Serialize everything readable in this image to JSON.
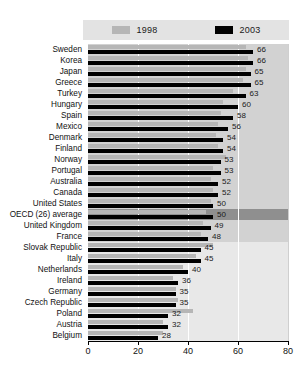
{
  "legend": {
    "entries": [
      {
        "label": "1998",
        "color": "#b6b6b6",
        "icon": "legend-swatch-1998"
      },
      {
        "label": "2003",
        "color": "#000000",
        "icon": "legend-swatch-2003"
      }
    ]
  },
  "axis": {
    "ticks": [
      "0",
      "20",
      "40",
      "60",
      "80"
    ],
    "tick_values": [
      0,
      20,
      40,
      60,
      80
    ],
    "min": 0,
    "max": 80
  },
  "highlight_row": "OECD (26) average",
  "chart_data": {
    "type": "bar",
    "orientation": "horizontal",
    "title": "",
    "subtitle": "",
    "xlabel": "",
    "ylabel": "",
    "xlim": [
      0,
      80
    ],
    "grid": true,
    "legend_position": "top",
    "categories": [
      "Sweden",
      "Korea",
      "Japan",
      "Greece",
      "Turkey",
      "Hungary",
      "Spain",
      "Mexico",
      "Denmark",
      "Finland",
      "Norway",
      "Portugal",
      "Australia",
      "Canada",
      "United States",
      "OECD (26) average",
      "United Kingdom",
      "France",
      "Slovak Republic",
      "Italy",
      "Netherlands",
      "Ireland",
      "Germany",
      "Czech Republic",
      "Poland",
      "Austria",
      "Belgium"
    ],
    "series": [
      {
        "name": "1998",
        "color": "#b6b6b6",
        "values": [
          63,
          64,
          63,
          62,
          58,
          54,
          53,
          52,
          51,
          52,
          55,
          50,
          49,
          50,
          49,
          47,
          46,
          45,
          50,
          43,
          38,
          34,
          35,
          36,
          42,
          30,
          30
        ]
      },
      {
        "name": "2003",
        "color": "#000000",
        "values": [
          66,
          66,
          65,
          65,
          63,
          60,
          58,
          56,
          54,
          54,
          53,
          53,
          52,
          52,
          50,
          50,
          49,
          48,
          45,
          45,
          40,
          36,
          35,
          35,
          32,
          32,
          28
        ],
        "labels": [
          "66",
          "66",
          "65",
          "65",
          "63",
          "60",
          "58",
          "56",
          "54",
          "54",
          "53",
          "53",
          "52",
          "52",
          "50",
          "50",
          "49",
          "48",
          "45",
          "45",
          "40",
          "36",
          "35",
          "35",
          "32",
          "32",
          "28"
        ]
      }
    ]
  }
}
